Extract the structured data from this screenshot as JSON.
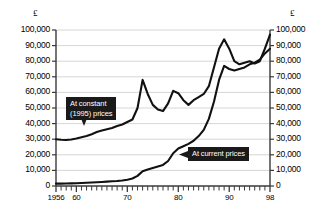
{
  "chart_data": {
    "type": "line",
    "title": "",
    "subtitle": "",
    "xlabel": "",
    "ylabel": "£",
    "ylabel_right": "£",
    "grid": true,
    "legend_position": "inline-annotations",
    "xlim": [
      1956,
      1998
    ],
    "ylim": [
      0,
      100000
    ],
    "ytick_labels": [
      "100,000",
      "90,000",
      "80,000",
      "70,000",
      "60,000",
      "50,000",
      "40,000",
      "30,000",
      "20,000",
      "10,000",
      "0"
    ],
    "ytick_values": [
      100000,
      90000,
      80000,
      70000,
      60000,
      50000,
      40000,
      30000,
      20000,
      10000,
      0
    ],
    "xtick_labels": [
      "1956",
      "60",
      "70",
      "80",
      "90",
      "98"
    ],
    "xtick_values": [
      1956,
      1960,
      1970,
      1980,
      1990,
      1998
    ],
    "x": [
      1956,
      1957,
      1958,
      1959,
      1960,
      1961,
      1962,
      1963,
      1964,
      1965,
      1966,
      1967,
      1968,
      1969,
      1970,
      1971,
      1972,
      1973,
      1974,
      1975,
      1976,
      1977,
      1978,
      1979,
      1980,
      1981,
      1982,
      1983,
      1984,
      1985,
      1986,
      1987,
      1988,
      1989,
      1990,
      1991,
      1992,
      1993,
      1994,
      1995,
      1996,
      1997,
      1998
    ],
    "series": [
      {
        "name": "At constant (1995) prices",
        "values": [
          30000,
          29600,
          29500,
          29800,
          30400,
          31200,
          32000,
          33200,
          34600,
          35600,
          36400,
          37200,
          38400,
          39400,
          41000,
          42600,
          50000,
          68000,
          59000,
          52000,
          49000,
          48000,
          53000,
          61000,
          59500,
          55000,
          52000,
          55000,
          57000,
          59000,
          64000,
          76000,
          88000,
          94000,
          88000,
          80000,
          78000,
          79000,
          80000,
          78500,
          80000,
          88000,
          97000
        ]
      },
      {
        "name": "At current prices",
        "values": [
          1500,
          1550,
          1600,
          1700,
          1800,
          1900,
          2050,
          2200,
          2400,
          2600,
          2800,
          3000,
          3200,
          3500,
          4000,
          4800,
          6500,
          9500,
          10500,
          11500,
          12500,
          13500,
          16000,
          21000,
          24000,
          25500,
          27000,
          29000,
          32000,
          36000,
          43000,
          54000,
          68000,
          77000,
          75000,
          74000,
          75000,
          76000,
          78000,
          79000,
          81000,
          85000,
          88000
        ]
      }
    ],
    "annotations": [
      {
        "name": "At constant (1995) prices",
        "text": "At constant\n(1995) prices",
        "style": "dark-callout-with-tail"
      },
      {
        "name": "At current prices",
        "text": "At current prices",
        "style": "dark-callout-with-left-arrow"
      }
    ],
    "colors": {
      "line": "#111111",
      "grid": "#cccccc",
      "axis": "#444444",
      "callout_bg": "#1a1a1a",
      "callout_text": "#ffffff",
      "background": "#ffffff"
    }
  }
}
